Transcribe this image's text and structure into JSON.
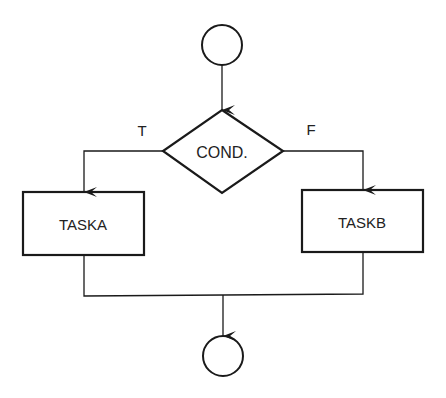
{
  "diagram": {
    "type": "flowchart",
    "start_node": {
      "shape": "circle",
      "label": ""
    },
    "decision": {
      "shape": "diamond",
      "label": "COND."
    },
    "branch_true_label": "T",
    "branch_false_label": "F",
    "task_a": {
      "shape": "rectangle",
      "label": "TASKA"
    },
    "task_b": {
      "shape": "rectangle",
      "label": "TASKB"
    },
    "end_node": {
      "shape": "circle",
      "label": ""
    },
    "colors": {
      "stroke": "#1a1a1a",
      "background": "#ffffff",
      "text": "#222222"
    }
  }
}
